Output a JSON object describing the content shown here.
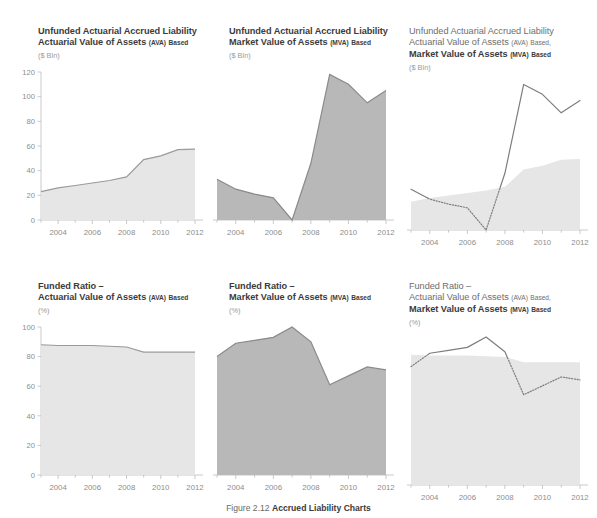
{
  "figure": {
    "caption_number": "Figure 2.12",
    "caption_text": "Accrued Liability Charts"
  },
  "colors": {
    "ava_fill": "#e6e6e6",
    "ava_stroke": "#9a9a9a",
    "mva_fill": "#b8b8b8",
    "mva_stroke": "#8a8a8a",
    "axis": "#bdbdbd",
    "text_dark": "#3c3c3c",
    "text_light": "#6e6e6e",
    "text_units": "#9a9a9a",
    "tick_label": "#8d8d8d"
  },
  "panels": [
    {
      "id": "uaal-ava",
      "title_line1": "Unfunded Actuarial Accrued Liability",
      "title_line2_main": "Actuarial Value of Assets",
      "title_line2_abbr": "(AVA)",
      "title_line2_tail": "Based",
      "title_line2_bold": true,
      "title_line1_bold": true,
      "title_line3_main": "",
      "title_line3_abbr": "",
      "title_line3_tail": "",
      "units": "($ Bln)",
      "show_y_labels": true
    },
    {
      "id": "uaal-mva",
      "title_line1": "Unfunded Actuarial Accrued Liability",
      "title_line2_main": "Market Value of Assets",
      "title_line2_abbr": "(MVA)",
      "title_line2_tail": "Based",
      "title_line2_bold": true,
      "title_line1_bold": true,
      "title_line3_main": "",
      "title_line3_abbr": "",
      "title_line3_tail": "",
      "units": "($ Bln)",
      "show_y_labels": false
    },
    {
      "id": "uaal-combined",
      "title_line1": "Unfunded Actuarial Accrued Liability",
      "title_line2_main": "Actuarial Value of Assets",
      "title_line2_abbr": "(AVA)",
      "title_line2_tail": "Based,",
      "title_line2_bold": false,
      "title_line1_bold": false,
      "title_line3_main": "Market Value of Assets",
      "title_line3_abbr": "(MVA)",
      "title_line3_tail": "Based",
      "units": "($ Bln)",
      "show_y_labels": false
    },
    {
      "id": "fr-ava",
      "title_line1": "Funded Ratio –",
      "title_line2_main": "Actuarial Value of Assets",
      "title_line2_abbr": "(AVA)",
      "title_line2_tail": "Based",
      "title_line2_bold": true,
      "title_line1_bold": true,
      "title_line3_main": "",
      "title_line3_abbr": "",
      "title_line3_tail": "",
      "units": "(%)",
      "show_y_labels": true
    },
    {
      "id": "fr-mva",
      "title_line1": "Funded Ratio –",
      "title_line2_main": "Market Value of Assets",
      "title_line2_abbr": "(MVA)",
      "title_line2_tail": "Based",
      "title_line2_bold": true,
      "title_line1_bold": true,
      "title_line3_main": "",
      "title_line3_abbr": "",
      "title_line3_tail": "",
      "units": "(%)",
      "show_y_labels": false
    },
    {
      "id": "fr-combined",
      "title_line1": "Funded Ratio –",
      "title_line2_main": "Actuarial Value of Assets",
      "title_line2_abbr": "(AVA)",
      "title_line2_tail": "Based,",
      "title_line2_bold": false,
      "title_line1_bold": false,
      "title_line3_main": "Market Value of Assets",
      "title_line3_abbr": "(MVA)",
      "title_line3_tail": "Based",
      "units": "(%)",
      "show_y_labels": false
    }
  ],
  "chart_data": [
    {
      "type": "area",
      "id": "uaal-ava",
      "title": "Unfunded Actuarial Accrued Liability — Actuarial Value of Assets (AVA) Based",
      "xlabel": "",
      "ylabel": "($ Bln)",
      "x": [
        2003,
        2004,
        2005,
        2006,
        2007,
        2008,
        2009,
        2010,
        2011,
        2012
      ],
      "xticks": [
        2004,
        2006,
        2008,
        2010,
        2012
      ],
      "xlim": [
        2003,
        2012
      ],
      "yticks": [
        0,
        20,
        40,
        60,
        80,
        100,
        120
      ],
      "ylim": [
        0,
        120
      ],
      "grid": false,
      "legend": "none",
      "series": [
        {
          "name": "AVA Based",
          "values": [
            23,
            26,
            28,
            30,
            32,
            35,
            49,
            52,
            57,
            57.5
          ]
        }
      ]
    },
    {
      "type": "area",
      "id": "uaal-mva",
      "title": "Unfunded Actuarial Accrued Liability — Market Value of Assets (MVA) Based",
      "xlabel": "",
      "ylabel": "($ Bln)",
      "x": [
        2003,
        2004,
        2005,
        2006,
        2007,
        2008,
        2009,
        2010,
        2011,
        2012
      ],
      "xticks": [
        2004,
        2006,
        2008,
        2010,
        2012
      ],
      "xlim": [
        2003,
        2012
      ],
      "yticks": [
        0,
        20,
        40,
        60,
        80,
        100,
        120
      ],
      "ylim": [
        0,
        120
      ],
      "grid": false,
      "legend": "none",
      "series": [
        {
          "name": "MVA Based",
          "values": [
            33,
            25,
            21,
            18,
            0,
            46,
            118,
            110,
            95,
            105
          ]
        }
      ]
    },
    {
      "type": "area",
      "id": "uaal-combined",
      "title": "Unfunded Actuarial Accrued Liability — AVA Based and MVA Based",
      "xlabel": "",
      "ylabel": "($ Bln)",
      "x": [
        2003,
        2004,
        2005,
        2006,
        2007,
        2008,
        2009,
        2010,
        2011,
        2012
      ],
      "xticks": [
        2004,
        2006,
        2008,
        2010,
        2012
      ],
      "xlim": [
        2003,
        2012
      ],
      "yticks": [
        0,
        20,
        40,
        60,
        80,
        100,
        120
      ],
      "ylim": [
        0,
        120
      ],
      "grid": false,
      "legend": "none",
      "series": [
        {
          "name": "AVA Based",
          "values": [
            23,
            26,
            28,
            30,
            32,
            35,
            49,
            52,
            57,
            57.5
          ]
        },
        {
          "name": "MVA Based",
          "values": [
            33,
            25,
            21,
            18,
            0,
            46,
            118,
            110,
            95,
            105
          ]
        }
      ]
    },
    {
      "type": "area",
      "id": "fr-ava",
      "title": "Funded Ratio — Actuarial Value of Assets (AVA) Based",
      "xlabel": "",
      "ylabel": "(%)",
      "x": [
        2003,
        2004,
        2005,
        2006,
        2007,
        2008,
        2009,
        2010,
        2011,
        2012
      ],
      "xticks": [
        2004,
        2006,
        2008,
        2010,
        2012
      ],
      "xlim": [
        2003,
        2012
      ],
      "yticks": [
        0,
        20,
        40,
        60,
        80,
        100
      ],
      "ylim": [
        0,
        100
      ],
      "grid": false,
      "legend": "none",
      "series": [
        {
          "name": "AVA Based",
          "values": [
            88,
            87.5,
            87.5,
            87.5,
            87,
            86.5,
            83,
            83,
            83,
            83
          ]
        }
      ]
    },
    {
      "type": "area",
      "id": "fr-mva",
      "title": "Funded Ratio — Market Value of Assets (MVA) Based",
      "xlabel": "",
      "ylabel": "(%)",
      "x": [
        2003,
        2004,
        2005,
        2006,
        2007,
        2008,
        2009,
        2010,
        2011,
        2012
      ],
      "xticks": [
        2004,
        2006,
        2008,
        2010,
        2012
      ],
      "xlim": [
        2003,
        2012
      ],
      "yticks": [
        0,
        20,
        40,
        60,
        80,
        100
      ],
      "ylim": [
        0,
        100
      ],
      "grid": false,
      "legend": "none",
      "series": [
        {
          "name": "MVA Based",
          "values": [
            80,
            89,
            91,
            93,
            100,
            90,
            61,
            67,
            73,
            71
          ]
        }
      ]
    },
    {
      "type": "area",
      "id": "fr-combined",
      "title": "Funded Ratio — AVA Based and MVA Based",
      "xlabel": "",
      "ylabel": "(%)",
      "x": [
        2003,
        2004,
        2005,
        2006,
        2007,
        2008,
        2009,
        2010,
        2011,
        2012
      ],
      "xticks": [
        2004,
        2006,
        2008,
        2010,
        2012
      ],
      "xlim": [
        2003,
        2012
      ],
      "yticks": [
        0,
        20,
        40,
        60,
        80,
        100
      ],
      "ylim": [
        0,
        100
      ],
      "grid": false,
      "legend": "none",
      "series": [
        {
          "name": "AVA Based",
          "values": [
            88,
            87.5,
            87.5,
            87.5,
            87,
            86.5,
            83,
            83,
            83,
            83
          ]
        },
        {
          "name": "MVA Based",
          "values": [
            80,
            89,
            91,
            93,
            100,
            90,
            61,
            67,
            73,
            71
          ]
        }
      ]
    }
  ]
}
